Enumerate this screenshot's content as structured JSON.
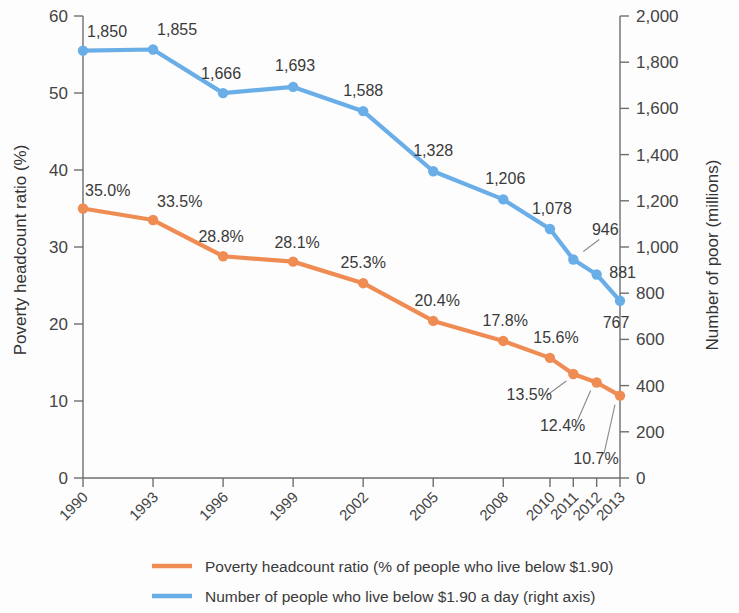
{
  "chart_data": {
    "type": "line",
    "title": "",
    "subtitle": "",
    "xlabel": "",
    "categories": [
      "1990",
      "1993",
      "1996",
      "1999",
      "2002",
      "2005",
      "2008",
      "2010",
      "2011",
      "2012",
      "2013"
    ],
    "left_axis": {
      "label": "Poverty headcount ratio (%)",
      "ticks": [
        "0",
        "10",
        "20",
        "30",
        "40",
        "50",
        "60"
      ],
      "tick_values": [
        0,
        10,
        20,
        30,
        40,
        50,
        60
      ],
      "min": 0,
      "max": 60
    },
    "right_axis": {
      "label": "Number of poor (millions)",
      "ticks": [
        "0",
        "200",
        "400",
        "600",
        "800",
        "1,000",
        "1,200",
        "1,400",
        "1,600",
        "1,800",
        "2,000"
      ],
      "tick_values": [
        0,
        200,
        400,
        600,
        800,
        1000,
        1200,
        1400,
        1600,
        1800,
        2000
      ],
      "min": 0,
      "max": 2000
    },
    "grid": false,
    "legend_position": "bottom",
    "series": [
      {
        "name": "Poverty headcount ratio (% of people who live below $1.90)",
        "axis": "left",
        "color": "#ef8c53",
        "values": [
          35.0,
          33.5,
          28.8,
          28.1,
          25.3,
          20.4,
          17.8,
          15.6,
          13.5,
          12.4,
          10.7
        ],
        "data_labels": [
          "35.0%",
          "33.5%",
          "28.8%",
          "28.1%",
          "25.3%",
          "20.4%",
          "17.8%",
          "15.6%",
          "13.5%",
          "12.4%",
          "10.7%"
        ]
      },
      {
        "name": "Number of people who live below $1.90 a day (right axis)",
        "axis": "right",
        "color": "#6aaee8",
        "values": [
          1850,
          1855,
          1666,
          1693,
          1588,
          1328,
          1206,
          1078,
          946,
          881,
          767
        ],
        "data_labels": [
          "1,850",
          "1,855",
          "1,666",
          "1,693",
          "1,588",
          "1,328",
          "1,206",
          "1,078",
          "946",
          "881",
          "767"
        ]
      }
    ]
  },
  "legend": {
    "items": [
      {
        "label": "Poverty headcount ratio (% of people who live below $1.90)",
        "color": "#ef8c53"
      },
      {
        "label": "Number of people who live below $1.90 a day (right axis)",
        "color": "#6aaee8"
      }
    ]
  },
  "colors": {
    "poverty_ratio": "#ef8c53",
    "number_of_poor": "#6aaee8",
    "axis": "#6e6e6e",
    "text": "#3a3a3a",
    "background": "#fdfdfd"
  }
}
